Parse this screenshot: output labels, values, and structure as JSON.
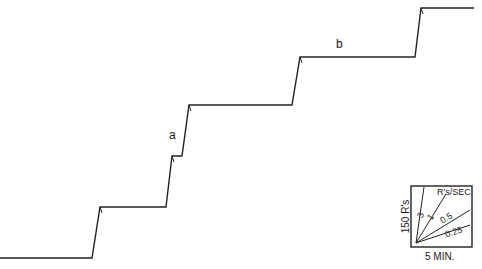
{
  "chart_data": {
    "type": "line",
    "title": "",
    "annotations": [
      {
        "text": "a",
        "x": 173,
        "y": 138
      },
      {
        "text": "b",
        "x": 340,
        "y": 48
      }
    ],
    "path_points": [
      [
        0,
        258
      ],
      [
        92,
        258
      ],
      [
        100,
        207
      ],
      [
        166,
        207
      ],
      [
        172,
        156
      ],
      [
        182,
        156
      ],
      [
        189,
        105
      ],
      [
        292,
        105
      ],
      [
        300,
        57
      ],
      [
        415,
        57
      ],
      [
        421,
        8
      ],
      [
        474,
        8
      ]
    ],
    "legend": {
      "y_scale": "150 R's",
      "x_scale": "5 MIN.",
      "rate_header": "R's/SEC",
      "rates": [
        "3",
        "1",
        "0.5",
        "0.25"
      ]
    }
  }
}
